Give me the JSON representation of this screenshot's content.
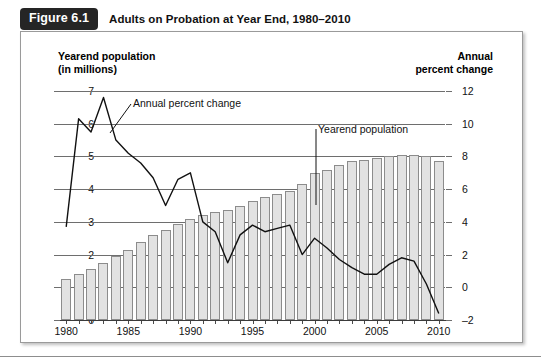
{
  "figure": {
    "badge": "Figure 6.1",
    "title": "Adults on Probation at Year End, 1980–2010"
  },
  "axis_titles": {
    "left_line1": "Yearend population",
    "left_line2": "(in millions)",
    "right_line1": "Annual",
    "right_line2": "percent change"
  },
  "annotations": {
    "line_series": "Annual percent change",
    "bar_series": "Yearend population"
  },
  "chart_data": {
    "type": "bar",
    "title": "Adults on Probation at Year End, 1980–2010",
    "xlabel": "",
    "ylabel": "Yearend population (in millions)",
    "y2label": "Annual percent change",
    "grid": true,
    "legend": "in-plot annotations",
    "x": [
      1980,
      1981,
      1982,
      1983,
      1984,
      1985,
      1986,
      1987,
      1988,
      1989,
      1990,
      1991,
      1992,
      1993,
      1994,
      1995,
      1996,
      1997,
      1998,
      1999,
      2000,
      2001,
      2002,
      2003,
      2004,
      2005,
      2006,
      2007,
      2008,
      2009,
      2010
    ],
    "xticks": [
      1980,
      1985,
      1990,
      1995,
      2000,
      2005,
      2010
    ],
    "yticks_left": [
      0,
      1,
      2,
      3,
      4,
      5,
      6,
      7
    ],
    "yticks_right": [
      -2,
      0,
      2,
      4,
      6,
      8,
      10,
      12
    ],
    "ylim": [
      0,
      7
    ],
    "y2lim": [
      -2,
      12
    ],
    "series": [
      {
        "name": "Yearend population",
        "type": "bar",
        "axis": "left",
        "units": "millions",
        "values": [
          1.25,
          1.4,
          1.55,
          1.75,
          1.95,
          2.15,
          2.4,
          2.6,
          2.75,
          2.95,
          3.1,
          3.2,
          3.3,
          3.35,
          3.5,
          3.65,
          3.75,
          3.85,
          3.95,
          4.15,
          4.5,
          4.6,
          4.75,
          4.85,
          4.9,
          4.95,
          5.0,
          5.05,
          5.05,
          5.0,
          4.85
        ]
      },
      {
        "name": "Annual percent change",
        "type": "line",
        "axis": "right",
        "units": "percent",
        "values": [
          3.7,
          10.3,
          9.5,
          11.6,
          9.0,
          8.2,
          7.6,
          6.7,
          5.0,
          6.6,
          7.0,
          4.0,
          3.4,
          1.5,
          3.2,
          3.8,
          3.4,
          3.6,
          3.8,
          2.0,
          3.0,
          2.4,
          1.7,
          1.2,
          0.8,
          0.8,
          1.4,
          1.8,
          1.6,
          0.2,
          -1.6
        ]
      }
    ]
  }
}
